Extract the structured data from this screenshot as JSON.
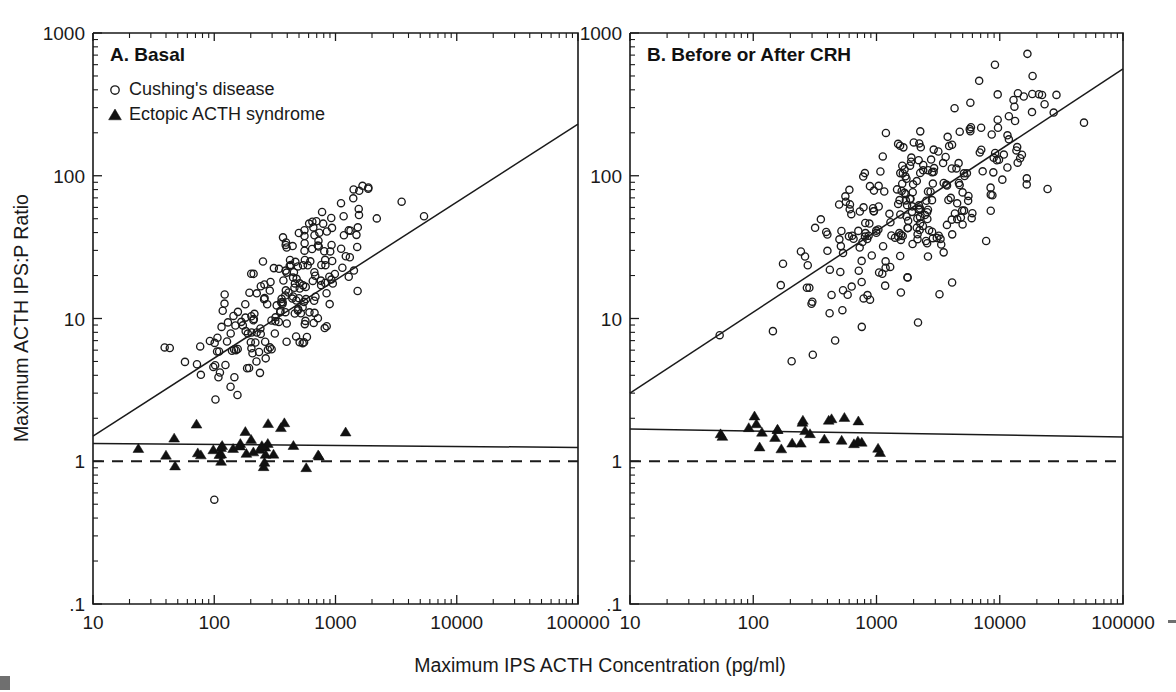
{
  "figure": {
    "xlabel": "Maximum IPS ACTH Concentration (pg/ml)",
    "ylabel": "Maximum ACTH IPS:P Ratio",
    "x_ticks": [
      "10",
      "100",
      "1000",
      "10000",
      "100000"
    ],
    "y_ticks": [
      "1000",
      "100",
      "10",
      "1",
      ".1"
    ],
    "ink_color": "#1a1a1a"
  },
  "legend": {
    "cushing_label": "Cushing's disease",
    "ectopic_label": "Ectopic ACTH syndrome",
    "cushing_marker": "open-circle",
    "ectopic_marker": "filled-triangle"
  },
  "chart_data": {
    "type": "scatter",
    "xlabel": "Maximum IPS ACTH Concentration (pg/ml)",
    "ylabel": "Maximum ACTH IPS:P Ratio",
    "xscale": "log",
    "yscale": "log",
    "xlim": [
      10,
      100000
    ],
    "ylim": [
      0.1,
      1000
    ],
    "xticks": [
      10,
      100,
      1000,
      10000,
      100000
    ],
    "yticks": [
      0.1,
      1,
      10,
      100,
      1000
    ],
    "grid": false,
    "legend_position": "top-left-panel-A",
    "panels": [
      {
        "id": "A",
        "label": "A. Basal",
        "series": [
          {
            "name": "Cushing's disease",
            "marker": "open-circle",
            "n_points": 212,
            "x_log_mean": 2.62,
            "x_log_sd": 0.4,
            "y_log_mean": 1.18,
            "y_log_sd": 0.36,
            "correlation": 0.72,
            "seed": 12345
          },
          {
            "name": "Ectopic ACTH syndrome",
            "marker": "filled-triangle",
            "n_points": 36,
            "x_log_mean": 2.25,
            "x_log_sd": 0.4,
            "y_log_mean": 0.095,
            "y_log_sd": 0.075,
            "correlation": 0.05,
            "seed": 777
          }
        ],
        "fit_lines": [
          {
            "name": "Cushing's regression",
            "style": "solid",
            "x_start": 10,
            "y_start": 1.5,
            "x_end": 100000,
            "y_end": 230
          },
          {
            "name": "Ectopic regression",
            "style": "solid",
            "x_start": 10,
            "y_start": 1.33,
            "x_end": 100000,
            "y_end": 1.25
          },
          {
            "name": "Ratio = 1 reference",
            "style": "dashed",
            "x_start": 10,
            "y_start": 1.0,
            "x_end": 100000,
            "y_end": 1.0
          }
        ]
      },
      {
        "id": "B",
        "label": "B. Before or After CRH",
        "series": [
          {
            "name": "Cushing's disease",
            "marker": "open-circle",
            "n_points": 268,
            "x_log_mean": 3.3,
            "x_log_sd": 0.47,
            "y_log_mean": 1.8,
            "y_log_sd": 0.38,
            "correlation": 0.7,
            "seed": 54321
          },
          {
            "name": "Ectopic ACTH syndrome",
            "marker": "filled-triangle",
            "n_points": 28,
            "x_log_mean": 2.4,
            "x_log_sd": 0.42,
            "y_log_mean": 0.175,
            "y_log_sd": 0.085,
            "correlation": 0.02,
            "seed": 999
          }
        ],
        "fit_lines": [
          {
            "name": "Cushing's regression",
            "style": "solid",
            "x_start": 10,
            "y_start": 3.0,
            "x_end": 100000,
            "y_end": 560
          },
          {
            "name": "Ectopic regression",
            "style": "solid",
            "x_start": 10,
            "y_start": 1.68,
            "x_end": 100000,
            "y_end": 1.48
          },
          {
            "name": "Ratio = 1 reference",
            "style": "dashed",
            "x_start": 10,
            "y_start": 1.0,
            "x_end": 100000,
            "y_end": 1.0
          }
        ]
      }
    ]
  },
  "panel_a": {
    "label": "A. Basal"
  },
  "panel_b": {
    "label": "B. Before or After CRH"
  }
}
